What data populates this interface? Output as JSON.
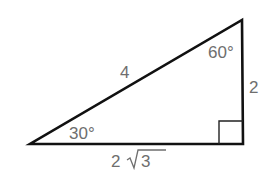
{
  "diagram": {
    "type": "right-triangle",
    "line_color": "#111111",
    "label_color": "#6e6e6e",
    "vertices": {
      "left": [
        30,
        144
      ],
      "right_angle": [
        243,
        144
      ],
      "top": [
        242,
        20
      ]
    },
    "labels": {
      "hypotenuse": "4",
      "vertical_side": "2",
      "base_prefix": "2",
      "base_radicand": "3",
      "angle_left": "30°",
      "angle_top": "60°"
    },
    "right_angle_marker": true
  }
}
